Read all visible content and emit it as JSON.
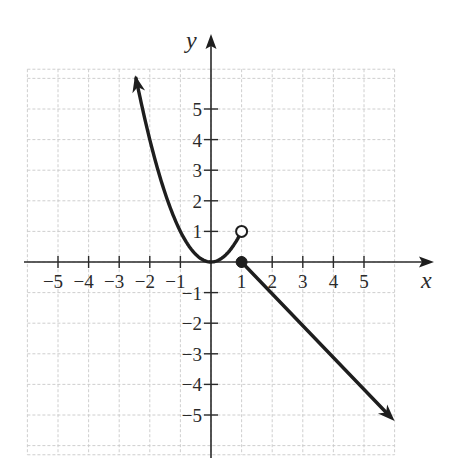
{
  "chart_data": {
    "type": "line",
    "title": "",
    "xlabel": "x",
    "ylabel": "y",
    "xlim": [
      -6,
      6
    ],
    "ylim": [
      -6,
      6
    ],
    "grid": true,
    "x_ticks": [
      -5,
      -4,
      -3,
      -2,
      -1,
      1,
      2,
      3,
      4,
      5
    ],
    "y_ticks": [
      -5,
      -4,
      -3,
      -2,
      -1,
      1,
      2,
      3,
      4,
      5
    ],
    "x_tick_labels": [
      "−5",
      "−4",
      "−3",
      "−2",
      "−1",
      "1",
      "2",
      "3",
      "4",
      "5"
    ],
    "y_tick_labels": [
      "−5",
      "−4",
      "−3",
      "−2",
      "−1",
      "1",
      "2",
      "3",
      "4",
      "5"
    ],
    "series": [
      {
        "name": "piece-1",
        "rule": "y = x^2 for x < 1",
        "domain": [
          -2.45,
          1
        ],
        "points": [
          [
            -2.45,
            6.0
          ],
          [
            -2,
            4
          ],
          [
            -1,
            1
          ],
          [
            0,
            0
          ],
          [
            0.5,
            0.25
          ],
          [
            1,
            1
          ]
        ],
        "left_end": "arrow",
        "right_end": "open-circle"
      },
      {
        "name": "piece-2",
        "rule": "y = -x + 1 for x >= 1",
        "domain": [
          1,
          6
        ],
        "points": [
          [
            1,
            0
          ],
          [
            2,
            -1
          ],
          [
            3,
            -2
          ],
          [
            4,
            -3
          ],
          [
            5,
            -4
          ],
          [
            6,
            -5
          ]
        ],
        "left_end": "closed-dot",
        "right_end": "arrow"
      }
    ],
    "markers": [
      {
        "type": "open-circle",
        "x": 1,
        "y": 1
      },
      {
        "type": "closed-dot",
        "x": 1,
        "y": 0
      }
    ]
  },
  "labels": {
    "x_axis": "x",
    "y_axis": "y"
  },
  "colors": {
    "curve": "#1e1e1e",
    "axis": "#2a2a2a",
    "grid": "#c8c8c8",
    "background": "#ffffff"
  }
}
